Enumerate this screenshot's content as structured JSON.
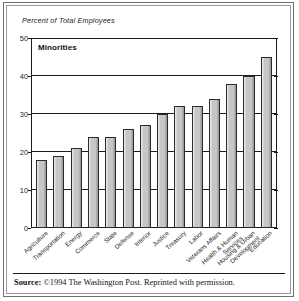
{
  "figure": {
    "axis_title": "Percent of Total Employees",
    "source_prefix": "Source:",
    "source_text": "©1994 The Washington Post. Reprinted with permission."
  },
  "chart_data": {
    "type": "bar",
    "title": "Minorities",
    "xlabel": "",
    "ylabel": "Percent of Total Employees",
    "ylim": [
      0,
      50
    ],
    "yticks": [
      0,
      10,
      20,
      30,
      40,
      50
    ],
    "grid": true,
    "legend": "none",
    "bar_color": "#c6c6c6",
    "bar_edge_color": "#2b2b2b",
    "categories": [
      "Agriculture",
      "Transportation",
      "Energy",
      "Commerce",
      "State",
      "Defense",
      "Interior",
      "Justice",
      "Treasury",
      "Labor",
      "Veterans Affairs",
      "Health & Human Services",
      "Housing & Urban Development",
      "Education"
    ],
    "categories_lines": [
      [
        "Agriculture"
      ],
      [
        "Transportation"
      ],
      [
        "Energy"
      ],
      [
        "Commerce"
      ],
      [
        "State"
      ],
      [
        "Defense"
      ],
      [
        "Interior"
      ],
      [
        "Justice"
      ],
      [
        "Treasury"
      ],
      [
        "Labor"
      ],
      [
        "Veterans Affairs"
      ],
      [
        "Health & Human",
        "Services"
      ],
      [
        "Housing & Urban",
        "Development"
      ],
      [
        "Education"
      ]
    ],
    "values": [
      18,
      19,
      21,
      24,
      24,
      26,
      27,
      30,
      32,
      32,
      34,
      38,
      40,
      45
    ]
  }
}
